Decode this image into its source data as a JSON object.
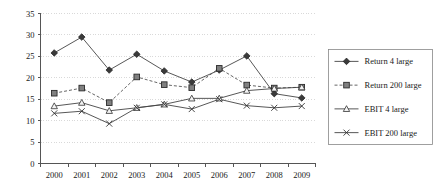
{
  "chart_data": {
    "type": "line",
    "title": "",
    "xlabel": "",
    "ylabel": "",
    "categories": [
      "2000",
      "2001",
      "2002",
      "2003",
      "2004",
      "2005",
      "2006",
      "2007",
      "2008",
      "2009"
    ],
    "ylim": [
      0,
      35
    ],
    "yticks": [
      0,
      5,
      10,
      15,
      20,
      25,
      30,
      35
    ],
    "grid": true,
    "legend_position": "right",
    "series": [
      {
        "name": "Return 4 large",
        "marker": "diamond",
        "linestyle": "solid",
        "color": "#3a3a3a",
        "values": [
          25.8,
          29.5,
          21.8,
          25.5,
          21.6,
          19.0,
          21.8,
          25.1,
          16.3,
          15.3
        ]
      },
      {
        "name": "Return 200 large",
        "marker": "square",
        "linestyle": "dashed",
        "color": "#808080",
        "values": [
          16.4,
          17.6,
          14.2,
          20.2,
          18.4,
          17.7,
          22.2,
          18.3,
          17.6,
          17.8
        ]
      },
      {
        "name": "EBIT 4 large",
        "marker": "triangle",
        "linestyle": "solid",
        "color": "#f2f2f2",
        "values": [
          13.4,
          14.2,
          12.3,
          13.0,
          13.8,
          15.2,
          15.2,
          17.0,
          17.5,
          17.8
        ]
      },
      {
        "name": "EBIT 200 large",
        "marker": "x",
        "linestyle": "solid",
        "color": "#333333",
        "values": [
          11.7,
          12.2,
          9.3,
          13.0,
          13.8,
          12.7,
          15.0,
          13.5,
          13.0,
          13.4
        ]
      }
    ]
  },
  "axis": {
    "y_tick_labels": [
      "0",
      "5",
      "10",
      "15",
      "20",
      "25",
      "30",
      "35"
    ],
    "x_tick_labels": [
      "2000",
      "2001",
      "2002",
      "2003",
      "2004",
      "2005",
      "2006",
      "2007",
      "2008",
      "2009"
    ]
  },
  "legend": {
    "entries": [
      {
        "label": "Return 4 large"
      },
      {
        "label": "Return 200 large"
      },
      {
        "label": "EBIT 4 large"
      },
      {
        "label": "EBIT 200 large"
      }
    ]
  }
}
